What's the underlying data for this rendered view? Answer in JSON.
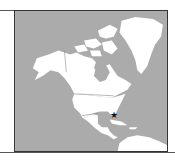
{
  "map": {
    "region": "North America",
    "colors": {
      "ocean": "#ababab",
      "land": "#ffffff",
      "border": "#8a8a8a",
      "frame": "#333333",
      "marker": "#111111"
    },
    "marker": {
      "icon": "star-icon",
      "glyph": "★",
      "location": "Caribbean, near Cuba / Bahamas"
    }
  }
}
